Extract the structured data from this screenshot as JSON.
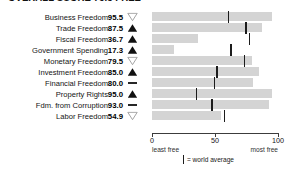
{
  "title": "OVERALL SCORE  76.3   FREE",
  "chart_data": {
    "type": "bar",
    "title": "OVERALL SCORE  76.3   FREE",
    "xlabel": "",
    "ylabel": "",
    "xlim": [
      0,
      100
    ],
    "grid": false,
    "legend_position": "bottom",
    "categories": [
      "Business Freedom",
      "Trade Freedom",
      "Fiscal Freedom",
      "Government Spending",
      "Monetary Freedom",
      "Investment Freedom",
      "Financial Freedom",
      "Property Rights",
      "Fdm. from Corruption",
      "Labor Freedom"
    ],
    "values": [
      95.5,
      87.5,
      36.7,
      17.3,
      79.5,
      85.0,
      80.0,
      95.0,
      93.0,
      54.9
    ],
    "trends": [
      "down",
      "up",
      "up",
      "up",
      "down",
      "up",
      "flat",
      "up",
      "flat",
      "down"
    ],
    "world_average": [
      60,
      74,
      77,
      62,
      73,
      51,
      49,
      35,
      47,
      57
    ],
    "axis_ticks": [
      0,
      50,
      100
    ],
    "axis_tick_labels": [
      "0",
      "50",
      "100"
    ],
    "axis_end_labels": {
      "low": "least free",
      "high": "most free"
    },
    "legend": {
      "symbol": "|",
      "text": "= world average"
    }
  },
  "rows": [
    {
      "label": "Business Freedom",
      "value": "95.5",
      "trend": "down",
      "bar_pct": 95.5,
      "avg": 60
    },
    {
      "label": "Trade Freedom",
      "value": "87.5",
      "trend": "up",
      "bar_pct": 87.5,
      "avg": 74
    },
    {
      "label": "Fiscal Freedom",
      "value": "36.7",
      "trend": "up",
      "bar_pct": 36.7,
      "avg": 77
    },
    {
      "label": "Government Spending",
      "value": "17.3",
      "trend": "up",
      "bar_pct": 17.3,
      "avg": 62
    },
    {
      "label": "Monetary Freedom",
      "value": "79.5",
      "trend": "down",
      "bar_pct": 79.5,
      "avg": 73
    },
    {
      "label": "Investment Freedom",
      "value": "85.0",
      "trend": "up",
      "bar_pct": 85.0,
      "avg": 51
    },
    {
      "label": "Financial Freedom",
      "value": "80.0",
      "trend": "flat",
      "bar_pct": 80.0,
      "avg": 49
    },
    {
      "label": "Property Rights",
      "value": "95.0",
      "trend": "up",
      "bar_pct": 95.0,
      "avg": 35
    },
    {
      "label": "Fdm. from Corruption",
      "value": "93.0",
      "trend": "flat",
      "bar_pct": 93.0,
      "avg": 47
    },
    {
      "label": "Labor Freedom",
      "value": "54.9",
      "trend": "down",
      "bar_pct": 54.9,
      "avg": 57
    }
  ],
  "axis": {
    "ticks": [
      {
        "label": "0",
        "pct": 0
      },
      {
        "label": "50",
        "pct": 50
      },
      {
        "label": "100",
        "pct": 100
      }
    ],
    "least_free": "least free",
    "most_free": "most free"
  },
  "legend": {
    "text": "= world average"
  },
  "colors": {
    "bar": "#d4d4d4",
    "average_mark": "#1c1c1c",
    "axis": "#3c3c3c",
    "text": "#141414"
  }
}
